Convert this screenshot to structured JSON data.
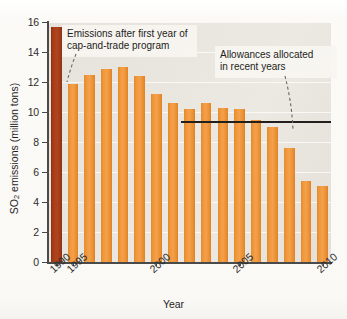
{
  "chart_data": {
    "type": "bar",
    "title": "",
    "xlabel": "Year",
    "ylabel": "SO2 emissions (million tons)",
    "ylabel_parts": {
      "pre": "SO",
      "sub": "2",
      "post": " emissions (million tons)"
    },
    "ylim": [
      0,
      16
    ],
    "ytick_values": [
      0,
      2,
      4,
      6,
      8,
      10,
      12,
      14,
      16
    ],
    "ytick_labels": [
      "0",
      "2",
      "4",
      "6",
      "8",
      "10",
      "12",
      "14",
      "16"
    ],
    "grid": true,
    "grid_axis": "y",
    "legend": "none",
    "categories": [
      1990,
      1995,
      1996,
      1997,
      1998,
      1999,
      2000,
      2001,
      2002,
      2003,
      2004,
      2005,
      2006,
      2007,
      2008,
      2009,
      2010
    ],
    "values": [
      15.7,
      11.9,
      12.5,
      12.9,
      13.0,
      12.4,
      11.2,
      10.6,
      10.2,
      10.6,
      10.3,
      10.2,
      9.5,
      9.0,
      7.6,
      5.4,
      5.1
    ],
    "bar_colors": [
      "#a93d18",
      "#f0963a",
      "#f0963a",
      "#f0963a",
      "#f0963a",
      "#f0963a",
      "#f0963a",
      "#f0963a",
      "#f0963a",
      "#f0963a",
      "#f0963a",
      "#f0963a",
      "#f0963a",
      "#f0963a",
      "#f0963a",
      "#f0963a",
      "#f0963a"
    ],
    "xtick_labels": [
      "1990",
      "1995",
      "2000",
      "2005",
      "2010"
    ],
    "xtick_categories": [
      1990,
      1995,
      2000,
      2005,
      2010
    ],
    "reference_line": {
      "label": "Allowances allocated in recent years",
      "value": 9.4,
      "start_category": 2002,
      "end_category": 2010,
      "color": "#221f1d"
    },
    "annotations": [
      {
        "id": "cap-and-trade-note",
        "text": "Emissions after first year of\ncap-and-trade program",
        "points_to_category": 1995
      },
      {
        "id": "allowances-note",
        "text": "Allowances allocated\nin recent years",
        "points_to_category": 2008
      }
    ],
    "plot_background": "#e9e5df",
    "accent_color": "#f0963a",
    "highlight_color": "#a93d18"
  }
}
